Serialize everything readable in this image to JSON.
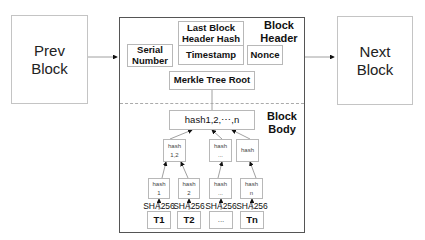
{
  "prev_block": {
    "label_line1": "Prev",
    "label_line2": "Block"
  },
  "next_block": {
    "label_line1": "Next",
    "label_line2": "Block"
  },
  "block_header": {
    "section_label_line1": "Block",
    "section_label_line2": "Header",
    "last_block_hash": {
      "line1": "Last Block",
      "line2": "Header Hash"
    },
    "serial_number": {
      "line1": "Serial",
      "line2": "Number"
    },
    "timestamp": "Timestamp",
    "nonce": "Nonce",
    "merkle_root": "Merkle Tree Root"
  },
  "block_body": {
    "section_label_line1": "Block",
    "section_label_line2": "Body",
    "root_hash": "hash1,2,⋯,n",
    "level2": [
      {
        "line1": "hash",
        "line2": "1,2"
      },
      {
        "line1": "hash",
        "line2": "..."
      },
      {
        "line1": "hash",
        "line2": ""
      }
    ],
    "level1": [
      {
        "line1": "hash",
        "line2": "1"
      },
      {
        "line1": "hash",
        "line2": "2"
      },
      {
        "line1": "hash",
        "line2": "..."
      },
      {
        "line1": "hash",
        "line2": "n"
      }
    ],
    "hash_function": [
      "SHA256",
      "SHA256",
      "SHA256",
      "SHA256"
    ],
    "transactions": [
      "T1",
      "T2",
      "...",
      "Tn"
    ]
  }
}
